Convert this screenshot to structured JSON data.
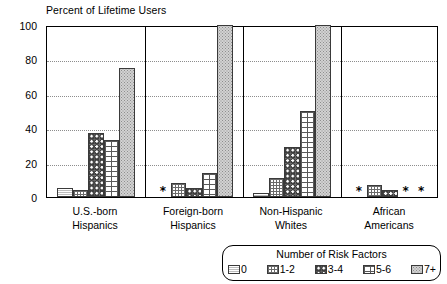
{
  "chart_data": {
    "type": "bar",
    "title": "Percent of Lifetime Users",
    "xlabel": "",
    "ylabel": "Percent of Lifetime Users",
    "ylim": [
      0,
      100
    ],
    "yticks": [
      0,
      20,
      40,
      60,
      80,
      100
    ],
    "ytick_labels": [
      "0",
      "20",
      "40",
      "60",
      "80",
      "100"
    ],
    "grid": true,
    "legend_position": "bottom-right",
    "legend_title": "Number of Risk Factors",
    "categories": [
      "U.S.-born\nHispanics",
      "Foreign-born\nHispanics",
      "Non-Hispanic\nWhites",
      "African\nAmericans"
    ],
    "category_lines": [
      [
        "U.S.-born",
        "Hispanics"
      ],
      [
        "Foreign-born",
        "Hispanics"
      ],
      [
        "Non-Hispanic",
        "Whites"
      ],
      [
        "African",
        "Americans"
      ]
    ],
    "series": [
      {
        "name": "0",
        "values": [
          5,
          null,
          2.5,
          null
        ]
      },
      {
        "name": "1-2",
        "values": [
          4,
          8,
          11,
          7
        ]
      },
      {
        "name": "3-4",
        "values": [
          37,
          5,
          29,
          4
        ]
      },
      {
        "name": "5-6",
        "values": [
          33,
          14,
          50,
          null
        ]
      },
      {
        "name": "7+",
        "values": [
          75,
          100,
          100,
          null
        ]
      }
    ],
    "suppressed_marker": "*",
    "suppressed_note": "Asterisk denotes estimate not shown",
    "annotations": [
      {
        "group": "Foreign-born Hispanics",
        "series": "0",
        "marker": "*"
      },
      {
        "group": "African Americans",
        "series": "0",
        "marker": "*"
      },
      {
        "group": "African Americans",
        "series": "5-6",
        "marker": "*"
      }
    ]
  },
  "legend": {
    "title": "Number of Risk Factors",
    "items": [
      {
        "label": "0"
      },
      {
        "label": "1-2"
      },
      {
        "label": "3-4"
      },
      {
        "label": "5-6"
      },
      {
        "label": "7+"
      }
    ]
  },
  "colors": {
    "axis": "#000000",
    "gridline": "#8d8d8d",
    "background": "#ffffff",
    "bar_outline": "#3a3a3a"
  }
}
